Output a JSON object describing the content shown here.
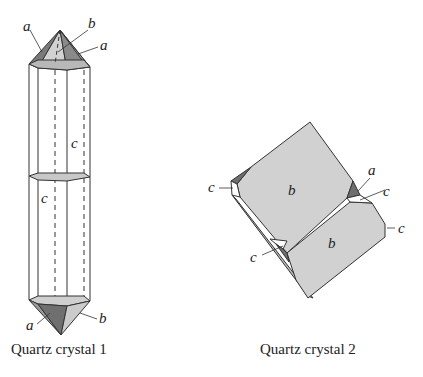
{
  "figure": {
    "crystal1": {
      "caption": "Quartz crystal 1",
      "labels": {
        "top_a_left": "a",
        "top_b": "b",
        "top_a_right": "a",
        "prism_c_upper": "c",
        "prism_c_lower": "c",
        "bottom_a": "a",
        "bottom_b": "b"
      }
    },
    "crystal2": {
      "caption": "Quartz crystal 2",
      "labels": {
        "upper_b": "b",
        "lower_b": "b",
        "left_c": "c",
        "right_a": "a",
        "right_c_upper": "c",
        "right_c_lower": "c",
        "bottom_c": "c"
      }
    },
    "colors": {
      "face_light": "#d6d6d6",
      "face_mid": "#b4b4b4",
      "face_dark": "#7a7a7a",
      "face_b": "#cfcfcf",
      "line": "#333333"
    }
  }
}
